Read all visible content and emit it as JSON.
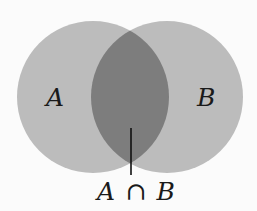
{
  "diagram": {
    "type": "venn",
    "sets": [
      {
        "id": "A",
        "label": "A",
        "cx": 93,
        "cy": 97,
        "r": 76
      },
      {
        "id": "B",
        "label": "B",
        "cx": 167,
        "cy": 97,
        "r": 76
      }
    ],
    "intersection": {
      "label_left": "A",
      "operator": "∩",
      "label_right": "B",
      "pointer": {
        "x": 131,
        "y1": 128,
        "y2": 175
      }
    },
    "colors": {
      "background": "#fbfbfb",
      "set_fill": "#bcbcbc",
      "intersection_fill": "#7d7d7d",
      "text": "#1a1a1a",
      "pointer": "#111111"
    }
  }
}
